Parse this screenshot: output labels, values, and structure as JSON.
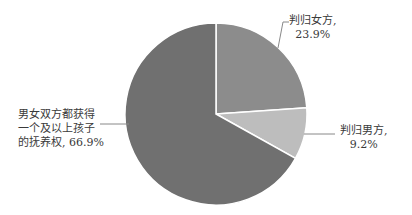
{
  "chart_data": {
    "type": "pie",
    "title": "",
    "slices": [
      {
        "label": "判归女方",
        "value": 23.9,
        "color": "#8c8c8c"
      },
      {
        "label": "判归男方",
        "value": 9.2,
        "color": "#bdbdbd"
      },
      {
        "label": "男女双方都获得一个及以上孩子的抚养权",
        "value": 66.9,
        "color": "#707070"
      }
    ],
    "start_angle_deg": 0,
    "direction": "clockwise"
  },
  "labels": {
    "female": {
      "line1": "判归女方,",
      "line2": "23.9%"
    },
    "male": {
      "line1": "判归男方,",
      "line2": "9.2%"
    },
    "both": {
      "line1": "男女双方都获得",
      "line2": "一个及以上孩子",
      "line3": "的抚养权, 66.9%"
    }
  }
}
